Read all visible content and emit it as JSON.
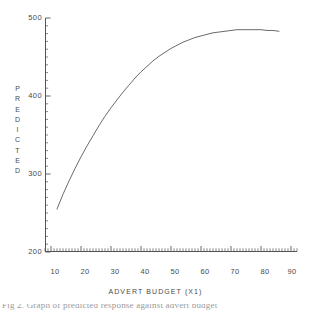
{
  "figure": {
    "background_color": "#ffffff",
    "line_color": "#5a5a5a",
    "axis_color": "#555555",
    "text_color": "#4a4a4a"
  },
  "y_axis": {
    "title_letters": [
      "P",
      "R",
      "E",
      "D",
      "I",
      "C",
      "T",
      "E",
      "D"
    ],
    "title": "PREDICTED",
    "tick_labels": [
      "500",
      "400",
      "300",
      "200"
    ],
    "tick_values": [
      500,
      400,
      300,
      200
    ],
    "range": [
      200,
      500
    ]
  },
  "x_axis": {
    "title": "ADVERT BUDGET (X1)",
    "tick_labels": [
      "10",
      "20",
      "30",
      "40",
      "50",
      "60",
      "70",
      "80",
      "90"
    ],
    "tick_values": [
      10,
      20,
      30,
      40,
      50,
      60,
      70,
      80,
      90
    ],
    "range": [
      8,
      92
    ]
  },
  "caption": {
    "text": "Fig 2. Graph of predicted response against advert budget"
  },
  "chart_data": {
    "type": "line",
    "title": "",
    "subtitle": "",
    "xlabel": "ADVERT BUDGET (X1)",
    "ylabel": "PREDICTED",
    "xlim": [
      8,
      92
    ],
    "ylim": [
      200,
      500
    ],
    "xticks": [
      10,
      20,
      30,
      40,
      50,
      60,
      70,
      80,
      90
    ],
    "yticks": [
      200,
      300,
      400,
      500
    ],
    "grid": false,
    "legend": false,
    "legend_position": "none",
    "minor_ticks": true,
    "series": [
      {
        "name": "predicted",
        "x": [
          12,
          14,
          16,
          18,
          20,
          22,
          24,
          26,
          28,
          30,
          32,
          34,
          36,
          38,
          40,
          42,
          44,
          46,
          48,
          50,
          52,
          54,
          56,
          58,
          60,
          62,
          64,
          66,
          68,
          70,
          72,
          74,
          76,
          78,
          80,
          82,
          84,
          86
        ],
        "y": [
          255,
          274,
          291,
          307,
          322,
          336,
          349,
          362,
          374,
          385,
          395,
          405,
          414,
          423,
          431,
          438,
          445,
          451,
          456,
          461,
          465,
          469,
          472,
          475,
          477,
          479,
          481,
          482,
          483,
          484,
          485,
          485,
          485,
          485,
          485,
          484,
          484,
          483
        ]
      }
    ]
  }
}
